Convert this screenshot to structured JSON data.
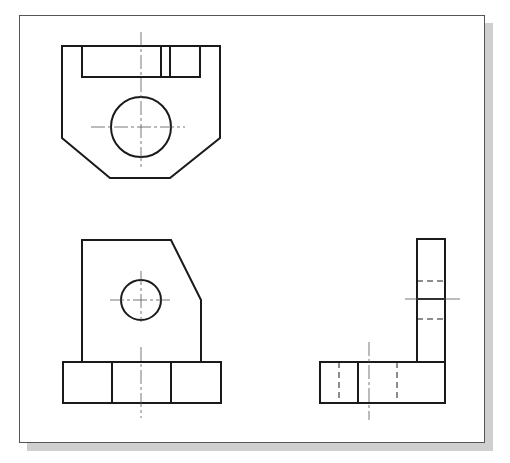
{
  "drawing": {
    "type": "orthographic-projection",
    "views": [
      {
        "name": "top-view",
        "features": [
          "slot",
          "through-hole",
          "chamfered-corners"
        ]
      },
      {
        "name": "front-view",
        "features": [
          "hole",
          "angled-edge",
          "base-segments"
        ]
      },
      {
        "name": "right-side-view",
        "features": [
          "hidden-lines",
          "l-profile"
        ]
      }
    ],
    "colors": {
      "line": "#1a1a1a",
      "centerline": "#555555",
      "frame_border": "#555555",
      "shadow": "#cfcfcf",
      "background": "#ffffff"
    }
  }
}
